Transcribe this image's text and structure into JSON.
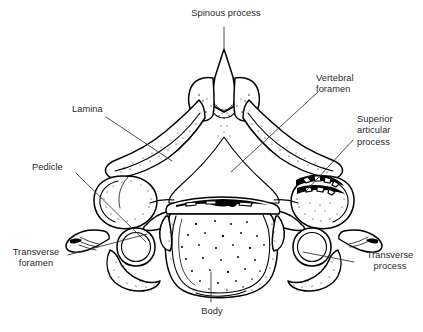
{
  "figure": {
    "view": "superior",
    "line_color": "#000000",
    "leader_color": "#3a3a3a",
    "text_color": "#2b2b2b",
    "background": "#ffffff"
  },
  "labels": [
    {
      "id": "spinous-process",
      "lines": [
        "Spinous process"
      ],
      "align": "center",
      "x": 168,
      "y": 8,
      "width": 116
    },
    {
      "id": "vertebral-foramen",
      "lines": [
        "Vertebral",
        "foramen"
      ],
      "align": "left",
      "x": 316,
      "y": 73,
      "width": 78
    },
    {
      "id": "superior-articular-process",
      "lines": [
        "Superior",
        "articular",
        "process"
      ],
      "align": "left",
      "x": 357,
      "y": 114,
      "width": 66
    },
    {
      "id": "lamina",
      "lines": [
        "Lamina"
      ],
      "align": "left",
      "x": 72,
      "y": 104,
      "width": 48
    },
    {
      "id": "pedicle",
      "lines": [
        "Pedicle"
      ],
      "align": "left",
      "x": 32,
      "y": 162,
      "width": 48
    },
    {
      "id": "transverse-foramen",
      "lines": [
        "Transverse",
        "foramen"
      ],
      "align": "center",
      "x": 2,
      "y": 247,
      "width": 68
    },
    {
      "id": "transverse-process",
      "lines": [
        "Transverse",
        "process"
      ],
      "align": "center",
      "x": 357,
      "y": 250,
      "width": 66
    },
    {
      "id": "body",
      "lines": [
        "Body"
      ],
      "align": "center",
      "x": 190,
      "y": 306,
      "width": 44
    }
  ],
  "leaders": [
    {
      "id": "leader-spinous-process",
      "points": "224,27 224,48"
    },
    {
      "id": "leader-vertebral-foramen",
      "points": "318,92 231,172"
    },
    {
      "id": "leader-superior-articular",
      "points": "353,140 306,191"
    },
    {
      "id": "leader-lamina",
      "points": "106,117 172,161"
    },
    {
      "id": "leader-pedicle",
      "points": "76,173 146,242"
    },
    {
      "id": "leader-transverse-foramen",
      "points": "68,255 147,234"
    },
    {
      "id": "leader-transverse-process",
      "points": "354,262 303,252"
    },
    {
      "id": "leader-body",
      "points": "211,302 211,272"
    }
  ],
  "anatomy_parts": [
    {
      "id": "spinous-process",
      "name": "Spinous process"
    },
    {
      "id": "lamina",
      "name": "Lamina"
    },
    {
      "id": "pedicle",
      "name": "Pedicle"
    },
    {
      "id": "vertebral-foramen",
      "name": "Vertebral foramen"
    },
    {
      "id": "superior-articular-process",
      "name": "Superior articular process"
    },
    {
      "id": "transverse-foramen",
      "name": "Transverse foramen"
    },
    {
      "id": "transverse-process",
      "name": "Transverse process"
    },
    {
      "id": "body",
      "name": "Body"
    }
  ]
}
